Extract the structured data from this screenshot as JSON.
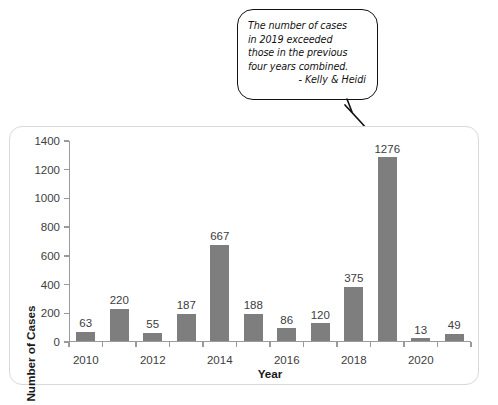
{
  "callout": {
    "text": "The number of cases\nin 2019 exceeded\nthose in the previous\nfour years combined.",
    "signature": "- Kelly & Heidi",
    "arrow_target": "2019-bar"
  },
  "chart_data": {
    "type": "bar",
    "title": "",
    "xlabel": "Year",
    "ylabel": "Number of Cases",
    "categories": [
      "2010",
      "2011",
      "2012",
      "2013",
      "2014",
      "2015",
      "2016",
      "2017",
      "2018",
      "2019",
      "2020",
      "2021"
    ],
    "values": [
      63,
      220,
      55,
      187,
      667,
      188,
      86,
      120,
      375,
      1276,
      13,
      49
    ],
    "value_labels": [
      "63",
      "220",
      "55",
      "187",
      "667",
      "188",
      "86",
      "120",
      "375",
      "1276",
      "13",
      "49"
    ],
    "xtick_labels": [
      "2010",
      "",
      "2012",
      "",
      "2014",
      "",
      "2016",
      "",
      "2018",
      "",
      "2020",
      ""
    ],
    "ytick_labels": [
      "0",
      "200",
      "400",
      "600",
      "800",
      "1000",
      "1200",
      "1400"
    ],
    "yticks": [
      0,
      200,
      400,
      600,
      800,
      1000,
      1200,
      1400
    ],
    "ylim": [
      0,
      1400
    ],
    "grid": false,
    "legend": false,
    "bar_color": "#7e7e7e",
    "axis_color": "#9a9a9a",
    "text_color": "#3d3d3d"
  }
}
